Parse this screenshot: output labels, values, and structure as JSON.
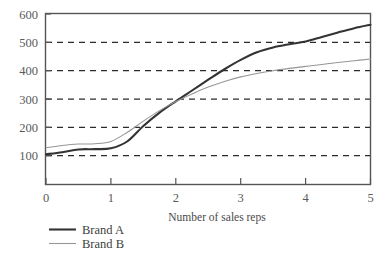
{
  "chart_data": {
    "type": "line",
    "title": "",
    "subtitle": "",
    "xlabel": "Number of sales reps",
    "ylabel": "",
    "xlim": [
      0,
      5
    ],
    "ylim": [
      0,
      600
    ],
    "xticks": [
      0,
      1,
      2,
      3,
      4,
      5
    ],
    "xtick_labels": [
      "0",
      "1",
      "2",
      "3",
      "4",
      "5"
    ],
    "yticks": [
      100,
      200,
      300,
      400,
      500,
      600
    ],
    "ytick_labels": [
      "100",
      "200",
      "300",
      "400",
      "500",
      "600"
    ],
    "grid": "horizontal-dashed",
    "grid_values": [
      100,
      200,
      300,
      400,
      500
    ],
    "legend_position": "below-left",
    "x": [
      0,
      0.25,
      0.5,
      0.75,
      1.0,
      1.25,
      1.5,
      1.75,
      2.0,
      2.25,
      2.5,
      2.75,
      3.0,
      3.25,
      3.5,
      3.75,
      4.0,
      4.25,
      4.5,
      4.75,
      5.0
    ],
    "series": [
      {
        "name": "Brand A",
        "color": "#333333",
        "line_width": 2.1,
        "values": [
          105,
          112,
          122,
          123,
          126,
          150,
          205,
          252,
          292,
          330,
          368,
          405,
          438,
          465,
          482,
          493,
          503,
          519,
          535,
          550,
          562
        ]
      },
      {
        "name": "Brand B",
        "color": "#969696",
        "line_width": 1.1,
        "values": [
          128,
          136,
          141,
          142,
          150,
          182,
          222,
          259,
          291,
          318,
          342,
          362,
          378,
          390,
          400,
          408,
          415,
          422,
          429,
          435,
          441
        ]
      }
    ]
  },
  "axes": {
    "x_axis_title": "Number of sales reps",
    "frame_color": "#555555",
    "grid_color": "#2b2b2b"
  },
  "legend": {
    "entries": [
      {
        "label": "Brand A",
        "swatch": "line-swatch-dark"
      },
      {
        "label": "Brand B",
        "swatch": "line-swatch-gray"
      }
    ]
  },
  "colors": {
    "background": "#ffffff",
    "brand_a": "#333333",
    "brand_b": "#969696",
    "text": "#4a4a4a"
  }
}
